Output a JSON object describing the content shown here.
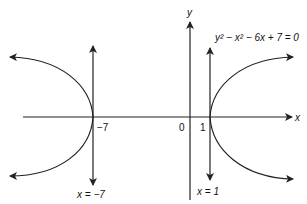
{
  "diagram": {
    "equation": "y² − x² − 6x + 7 = 0",
    "axes": {
      "x_label": "x",
      "y_label": "y",
      "origin_label": "0"
    },
    "tick_labels": {
      "left_vertex": "−7",
      "right_vertex": "1"
    },
    "asymptote_labels": {
      "left": "x = −7",
      "right": "x = 1"
    },
    "colors": {
      "stroke": "#222222",
      "background": "#ffffff"
    }
  }
}
